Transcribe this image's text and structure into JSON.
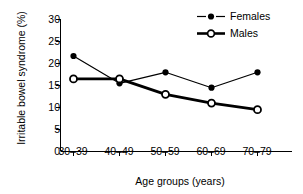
{
  "chart_data": {
    "type": "line",
    "title": "",
    "xlabel": "Age groups (years)",
    "ylabel": "Irritable bowel syndrome (%)",
    "categories": [
      "30–39",
      "40–49",
      "50–59",
      "60–69",
      "70–79"
    ],
    "ylim": [
      0,
      30
    ],
    "yticks": [
      0,
      5,
      10,
      15,
      20,
      25,
      30
    ],
    "ytick_labels": [
      "0",
      "5",
      "10",
      "15",
      "20",
      "25",
      "30"
    ],
    "grid": false,
    "legend_position": "top-right",
    "series": [
      {
        "name": "Females",
        "marker": "filled-circle",
        "line_width": "thin",
        "color": "#000000",
        "values": [
          21.7,
          15.5,
          18.0,
          14.5,
          18.0
        ]
      },
      {
        "name": "Males",
        "marker": "open-circle",
        "line_width": "thick",
        "color": "#000000",
        "values": [
          16.5,
          16.5,
          13.0,
          11.0,
          9.5
        ]
      }
    ]
  },
  "legend": {
    "entries": [
      {
        "label": "Females",
        "marker": "filled-circle-marker-icon"
      },
      {
        "label": "Males",
        "marker": "open-circle-marker-icon"
      }
    ]
  },
  "axes": {
    "origin_label": "0"
  }
}
